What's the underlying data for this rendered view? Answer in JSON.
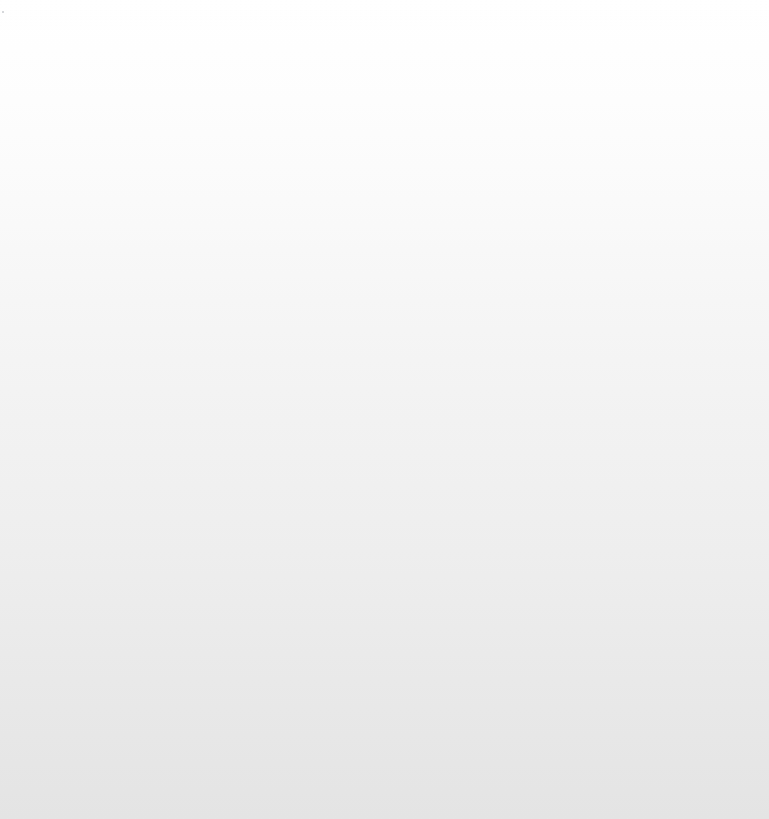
{
  "screen": {
    "width_px": 769,
    "height_px": 819,
    "state_label": "",
    "has_visible_text": false,
    "has_visible_controls": false
  },
  "canvas": {
    "type": "vertical-linear-gradient",
    "direction": "top-to-bottom",
    "top_color": "#ffffff",
    "bottom_color": "#e4e4e4",
    "stops": [
      {
        "position_px": 0,
        "position_pct": "0%",
        "color": "#ffffff"
      },
      {
        "position_px": 100,
        "position_pct": "12.2%",
        "color": "#fdfdfd"
      },
      {
        "position_px": 200,
        "position_pct": "24.4%",
        "color": "#fafafa"
      },
      {
        "position_px": 300,
        "position_pct": "36.6%",
        "color": "#f6f6f6"
      },
      {
        "position_px": 420,
        "position_pct": "51.3%",
        "color": "#f2f2f2"
      },
      {
        "position_px": 550,
        "position_pct": "67.2%",
        "color": "#eeeeee"
      },
      {
        "position_px": 680,
        "position_pct": "83.0%",
        "color": "#e9e9e9"
      },
      {
        "position_px": 819,
        "position_pct": "100%",
        "color": "#e4e4e4"
      }
    ]
  },
  "artifacts": {
    "top_noise_band": {
      "present": true,
      "top_px": 0,
      "height_px": 26,
      "description_label": ""
    },
    "corner_speck": {
      "present": true,
      "x_px": 2,
      "y_px": 11,
      "color": "#787d87"
    },
    "gradient_banding": {
      "present": true,
      "band_spacing_px": 8
    }
  },
  "empty_area": {
    "label": ""
  }
}
